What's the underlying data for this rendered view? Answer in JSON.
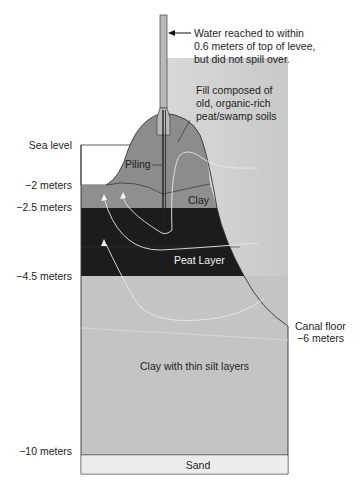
{
  "diagram": {
    "annotations": {
      "water_note": [
        "Water reached to within",
        "0.6 meters of top of levee,",
        "but did not spill over."
      ],
      "fill_note": [
        "Fill composed of",
        "old, organic-rich",
        "peat/swamp soils"
      ],
      "piling": "Piling",
      "canal_floor": [
        "Canal floor",
        "−6 meters"
      ]
    },
    "depth_labels": {
      "sea_level": "Sea level",
      "minus_2": "−2 meters",
      "minus_2_5": "−2.5 meters",
      "minus_4_5": "−4.5 meters",
      "minus_10": "−10 meters"
    },
    "layers": {
      "clay": "Clay",
      "peat": "Peat Layer",
      "clay_silt": "Clay with thin silt layers",
      "sand": "Sand"
    },
    "colors": {
      "fill_levee": "#8c8c8c",
      "clay": "#8f8f8f",
      "peat": "#1c1c1c",
      "clay_silt": "#c4c4c4",
      "sand": "#ececec",
      "canal_water": "#cfcfcf",
      "piling": "#b8b8b8",
      "flow_arrows": "#e8e8e8"
    }
  }
}
